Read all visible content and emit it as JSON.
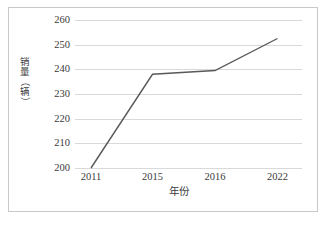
{
  "chart_data": {
    "type": "line",
    "title": "",
    "xlabel": "年份",
    "ylabel": "销量（辆）",
    "categories": [
      "2011",
      "2015",
      "2016",
      "2022"
    ],
    "x": [
      2011,
      2015,
      2016,
      2022
    ],
    "values": [
      200,
      238,
      239.5,
      252.5
    ],
    "series": [
      {
        "name": "销量（辆）",
        "values": [
          200,
          238,
          239.5,
          252.5
        ]
      }
    ],
    "ylim": [
      200,
      260
    ],
    "yticks": [
      200,
      210,
      220,
      230,
      240,
      250,
      260
    ],
    "ytick_labels": [
      "200",
      "210",
      "220",
      "230",
      "240",
      "250",
      "260"
    ],
    "xtick_labels": [
      "2011",
      "2015",
      "2016",
      "2022"
    ],
    "grid": "horizontal",
    "legend": "none",
    "line_color": "#595959",
    "grid_color": "#d9d9d9",
    "frame_color": "#c9c9c9",
    "text_color": "#3b3b3b",
    "markers": "none"
  },
  "axis": {
    "y_title_chars": [
      "销",
      "量",
      "（",
      "辆",
      "）"
    ],
    "x_title": "年份"
  }
}
